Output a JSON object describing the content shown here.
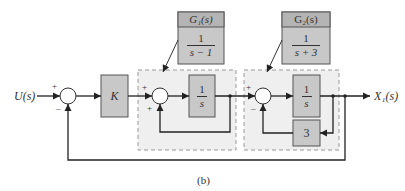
{
  "diagram": {
    "caption": "(b)",
    "input_label": "U(s)",
    "output_label": "X₁(s)",
    "colors": {
      "block_fill": "#c8c8c8",
      "block_header_fill": "#b4b4b4",
      "dashed_region_fill": "#efefef",
      "line": "#222222"
    },
    "summing_junctions": [
      {
        "id": "sum1",
        "signs": {
          "input": "+",
          "feedback": "–"
        }
      },
      {
        "id": "sum2",
        "signs": {
          "input": "+",
          "feedback": "+"
        }
      },
      {
        "id": "sum3",
        "signs": {
          "input": "+",
          "feedback": "–"
        }
      }
    ],
    "blocks": {
      "gain": {
        "label": "K"
      },
      "integrator1": {
        "numerator": "1",
        "denominator": "s"
      },
      "integrator2": {
        "numerator": "1",
        "denominator": "s"
      },
      "feedback_gain": {
        "label": "3"
      }
    },
    "callouts": {
      "g1": {
        "title": "G₁(s)",
        "numerator": "1",
        "denominator": "s − 1"
      },
      "g2": {
        "title": "G₂(s)",
        "numerator": "1",
        "denominator": "s + 3"
      }
    }
  }
}
